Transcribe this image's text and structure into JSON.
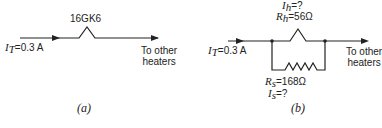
{
  "figure_a": {
    "tube_label": "16GK6",
    "current_symbol": "I",
    "current_sub": "T",
    "current_value": "=0.3 A",
    "to_other_line1": "To other",
    "to_other_line2": "heaters",
    "caption": "(a)"
  },
  "figure_b": {
    "ih_symbol": "I",
    "ih_sub": "h",
    "ih_value": "=?",
    "rh_symbol": "R",
    "rh_sub": "h",
    "rh_value": "=56Ω",
    "current_symbol": "I",
    "current_sub": "T",
    "current_value": "=0.3 A",
    "to_other_line1": "To other",
    "to_other_line2": "heaters",
    "rs_symbol": "R",
    "rs_sub": "s",
    "rs_value": "=168Ω",
    "is_symbol": "I",
    "is_sub": "s",
    "is_value": "=?",
    "caption": "(b)"
  }
}
